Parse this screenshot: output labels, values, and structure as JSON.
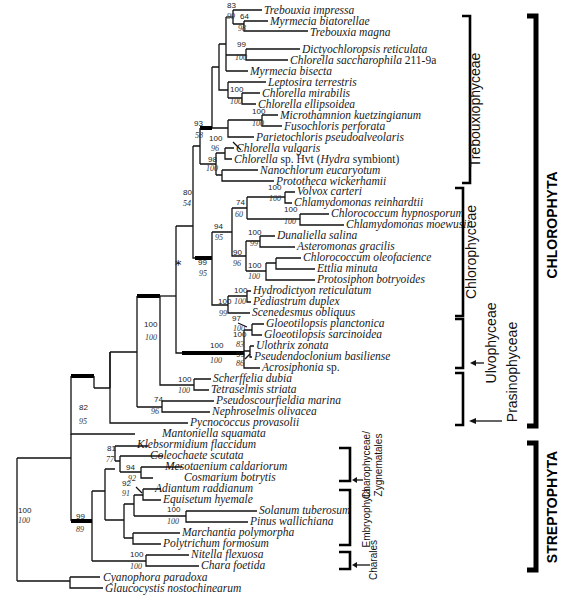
{
  "figure": {
    "type": "phylogenetic-tree",
    "asterisk_label": "*",
    "taxa": [
      {
        "id": "t1",
        "name": "Trebouxia impressa",
        "y": 10
      },
      {
        "id": "t2",
        "name": "Myrmecia biatorellae",
        "y": 21
      },
      {
        "id": "t3",
        "name": "Trebouxia magna",
        "y": 31
      },
      {
        "id": "t4",
        "name": "Dictyochloropsis reticulata",
        "y": 49
      },
      {
        "id": "t5",
        "name": "Chlorella saccharophila",
        "suffix": " 211-9a",
        "y": 60
      },
      {
        "id": "t6",
        "name": "Myrmecia bisecta",
        "y": 71
      },
      {
        "id": "t7",
        "name": "Leptosira terrestris",
        "y": 82
      },
      {
        "id": "t8",
        "name": "Chlorella mirabilis",
        "y": 93
      },
      {
        "id": "t9",
        "name": "Chlorella ellipsoidea",
        "y": 104
      },
      {
        "id": "t10",
        "name": "Microthamnion kuetzingianum",
        "y": 115
      },
      {
        "id": "t11",
        "name": "Fusochloris perforata",
        "y": 126
      },
      {
        "id": "t12",
        "name": "Parietochloris pseudoalveolaris",
        "y": 137
      },
      {
        "id": "t13",
        "name": "Chlorella vulgaris",
        "y": 148
      },
      {
        "id": "t14",
        "name": "Chlorella",
        "suffix": " sp. Hvt (",
        "italic2": "Hydra",
        "suffix2": " symbiont)",
        "y": 159
      },
      {
        "id": "t15",
        "name": "Nanochlorum eucaryotum",
        "y": 170
      },
      {
        "id": "t16",
        "name": "Prototheca wickerhamii",
        "y": 181
      },
      {
        "id": "t17",
        "name": "Volvox carteri",
        "y": 192
      },
      {
        "id": "t18",
        "name": "Chlamydomonas reinhardtii",
        "y": 203
      },
      {
        "id": "t19",
        "name": "Chlorococcum hypnosporum",
        "y": 214
      },
      {
        "id": "t20",
        "name": "Chlamydomonas moewusii",
        "y": 225
      },
      {
        "id": "t21",
        "name": "Dunaliella salina",
        "y": 236
      },
      {
        "id": "t22",
        "name": "Asteromonas gracilis",
        "y": 247
      },
      {
        "id": "t23",
        "name": "Chlorococcum oleofacience",
        "y": 258
      },
      {
        "id": "t24",
        "name": "Ettlia minuta",
        "y": 269
      },
      {
        "id": "t25",
        "name": "Protosiphon botryoides",
        "y": 280
      },
      {
        "id": "t26",
        "name": "Hydrodictyon reticulatum",
        "y": 291
      },
      {
        "id": "t27",
        "name": "Pediastrum duplex",
        "y": 302
      },
      {
        "id": "t28",
        "name": "Scenedesmus obliquus",
        "y": 313
      },
      {
        "id": "t29",
        "name": "Gloeotilopsis planctonica",
        "y": 324
      },
      {
        "id": "t30",
        "name": "Gloeotilopsis sarcinoidea",
        "y": 335
      },
      {
        "id": "t31",
        "name": "Ulothrix zonata",
        "y": 346
      },
      {
        "id": "t32",
        "name": "Pseudendoclonium basiliense",
        "y": 357
      },
      {
        "id": "t33",
        "name": "Acrosiphonia",
        "suffix": " sp.",
        "y": 368
      },
      {
        "id": "t34",
        "name": "Scherffelia dubia",
        "y": 379
      },
      {
        "id": "t35",
        "name": "Tetraselmis striata",
        "y": 390
      },
      {
        "id": "t36",
        "name": "Pseudoscourfieldia marina",
        "y": 401
      },
      {
        "id": "t37",
        "name": "Nephroselmis olivacea",
        "y": 412
      },
      {
        "id": "t38",
        "name": "Pycnococcus provasolii",
        "y": 423
      },
      {
        "id": "t39",
        "name": "Mantoniella squamata",
        "y": 434
      },
      {
        "id": "t40",
        "name": "Klebsormidium flaccidum",
        "y": 445
      },
      {
        "id": "t41",
        "name": "Coleochaete scutata",
        "y": 456
      },
      {
        "id": "t42",
        "name": "Mesotaenium caldariorum",
        "y": 467
      },
      {
        "id": "t43",
        "name": "Cosmarium botrytis",
        "y": 478
      },
      {
        "id": "t44",
        "name": "Adiantum raddianum",
        "y": 489
      },
      {
        "id": "t45",
        "name": "Equisetum hyemale",
        "y": 500
      },
      {
        "id": "t46",
        "name": "Solanum tuberosum",
        "y": 511
      },
      {
        "id": "t47",
        "name": "Pinus wallichiana",
        "y": 522
      },
      {
        "id": "t48",
        "name": "Marchantia polymorpha",
        "y": 533
      },
      {
        "id": "t49",
        "name": "Polytrichum formosum",
        "y": 544
      },
      {
        "id": "t50",
        "name": "Nitella flexuosa",
        "y": 555
      },
      {
        "id": "t51",
        "name": "Chara foetida",
        "y": 566
      },
      {
        "id": "t52",
        "name": "Cyanophora paradoxa",
        "y": 577
      },
      {
        "id": "t53",
        "name": "Glaucocystis nostochinearum",
        "y": 588
      }
    ],
    "support_values": [
      {
        "top": "83",
        "bottom": "99"
      },
      {
        "top": "64",
        "bottom": "98"
      },
      {
        "top": "99",
        "bottom": "100"
      },
      {
        "top": "100",
        "bottom": "100"
      },
      {
        "top": "100",
        "bottom": "100"
      },
      {
        "top": "93",
        "bottom": "58"
      },
      {
        "top": "100",
        "bottom": "96"
      },
      {
        "top": "98",
        "bottom": "100"
      },
      {
        "top": "80",
        "bottom": "54"
      },
      {
        "top": "100",
        "bottom": "100"
      },
      {
        "top": "74",
        "bottom": "60"
      },
      {
        "top": "100",
        "bottom": "100"
      },
      {
        "top": "94",
        "bottom": "95"
      },
      {
        "top": "100",
        "bottom": "99"
      },
      {
        "top": "90",
        "bottom": "96"
      },
      {
        "top": "100",
        "bottom": "100"
      },
      {
        "top": "99",
        "bottom": "95"
      },
      {
        "top": "100",
        "bottom": "100"
      },
      {
        "top": "100",
        "bottom": "99"
      },
      {
        "top": "97",
        "bottom": "100"
      },
      {
        "top": "100",
        "bottom": "83"
      },
      {
        "top": "99",
        "bottom": "86"
      },
      {
        "top": "100",
        "bottom": "100"
      },
      {
        "top": "100",
        "bottom": "100"
      },
      {
        "top": "100",
        "bottom": "100"
      },
      {
        "top": "74",
        "bottom": "96"
      },
      {
        "top": "82",
        "bottom": "95"
      },
      {
        "top": "81",
        "bottom": "77"
      },
      {
        "top": "94",
        "bottom": "92"
      },
      {
        "top": "92",
        "bottom": "91"
      },
      {
        "top": "100",
        "bottom": "100"
      },
      {
        "top": "99",
        "bottom": "89"
      },
      {
        "top": "100",
        "bottom": "100"
      },
      {
        "top": "100",
        "bottom": "100"
      }
    ],
    "clade_labels": {
      "trebouxiophyceae": "Trebouxiophyceae",
      "chlorophyceae": "Chlorophyceae",
      "ulvophyceae": "Ulvophyceae",
      "prasinophyceae": "Prasinophyceae",
      "charophyceae_line1": "Charophyceae/",
      "charophyceae_line2": "Zygnematales",
      "embryophyta": "Embryophyta",
      "charales": "Charales"
    },
    "phylum_labels": {
      "chlorophyta": "CHLOROPHYTA",
      "streptophyta": "STREPTOPHYTA"
    }
  }
}
